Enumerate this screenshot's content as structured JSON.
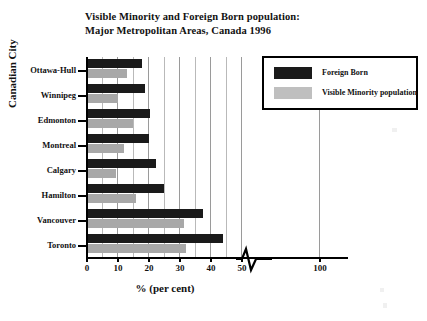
{
  "chart_data": {
    "type": "bar",
    "orientation": "horizontal",
    "title": "Visible Minority and Foreign Born population: Major Metropolitan Areas, Canada 1996",
    "title_lines": [
      "Visible Minority and Foreign Born population:",
      "Major Metropolitan Areas, Canada 1996"
    ],
    "xlabel": "% (per cent)",
    "ylabel": "Canadian City",
    "categories": [
      "Ottawa-Hull",
      "Winnipeg",
      "Edmonton",
      "Montreal",
      "Calgary",
      "Hamilton",
      "Vancouver",
      "Toronto"
    ],
    "series": [
      {
        "name": "Foreign Born",
        "color": "#1a1a1a",
        "values": [
          17.5,
          18.5,
          20.0,
          19.8,
          22.0,
          24.5,
          37.0,
          43.5
        ]
      },
      {
        "name": "Visible Minority population",
        "color": "#a8a8a8",
        "values": [
          12.5,
          9.8,
          14.5,
          11.5,
          9.0,
          15.5,
          31.0,
          31.5
        ]
      }
    ],
    "xlim": [
      0,
      50
    ],
    "xticks": [
      0,
      10,
      20,
      30,
      40,
      50,
      100
    ],
    "xtick_labels": [
      "0",
      "10",
      "20",
      "30",
      "40",
      "50",
      "100"
    ],
    "minor_gridlines": [
      5,
      10,
      15,
      20,
      25,
      30,
      35,
      40,
      45,
      50
    ],
    "axis_break": {
      "present": true,
      "between": [
        50,
        100
      ],
      "style": "zigzag"
    },
    "grid": "vertical",
    "legend_position": "top-right",
    "legend_entries": [
      "Foreign Born",
      "Visible Minority population"
    ]
  }
}
